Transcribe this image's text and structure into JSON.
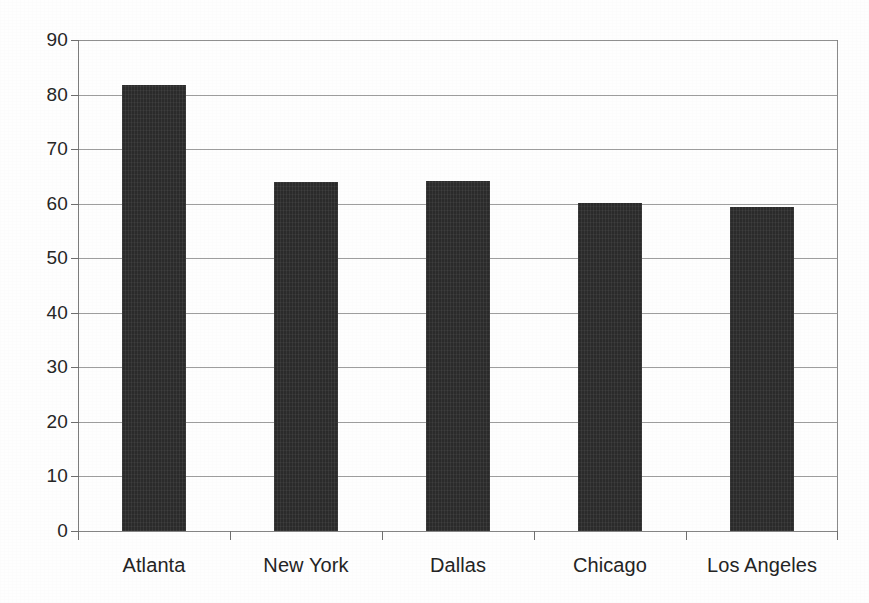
{
  "chart_data": {
    "type": "bar",
    "title": "",
    "subtitle": "",
    "xlabel": "",
    "ylabel": "",
    "categories": [
      "Atlanta",
      "New York",
      "Dallas",
      "Chicago",
      "Los Angeles"
    ],
    "values": [
      81.8,
      64.0,
      64.2,
      60.2,
      59.4
    ],
    "ylim": [
      0,
      90
    ],
    "ytick_step": 10,
    "ytick_labels": [
      "0",
      "10",
      "20",
      "30",
      "40",
      "50",
      "60",
      "70",
      "80",
      "90"
    ],
    "grid": true,
    "grid_orientation": "horizontal",
    "legend": false,
    "legend_position": "none",
    "bar_color": "#2b2b2b",
    "gridline_color": "#8d8d8d",
    "axis_color": "#7c7c7c",
    "background_color": "#fefefe",
    "text_color": "#242424",
    "series": [
      {
        "name": "",
        "values": [
          81.8,
          64.0,
          64.2,
          60.2,
          59.4
        ]
      }
    ]
  }
}
